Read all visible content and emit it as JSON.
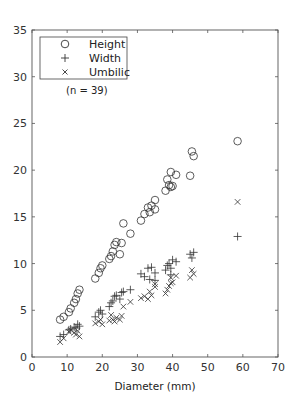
{
  "chart_data": {
    "type": "scatter",
    "title": "",
    "xlabel": "Diameter (mm)",
    "ylabel": "",
    "xlim": [
      0,
      70
    ],
    "ylim": [
      0,
      35
    ],
    "xticks": [
      0,
      10,
      20,
      30,
      40,
      50,
      60,
      70
    ],
    "yticks": [
      0,
      5,
      10,
      15,
      20,
      25,
      30,
      35
    ],
    "grid": false,
    "legend_position": "upper left",
    "annotations": [
      "(n = 39)"
    ],
    "series": [
      {
        "name": "Height",
        "marker": "circle",
        "points": [
          [
            8,
            4.0
          ],
          [
            9,
            4.3
          ],
          [
            10.5,
            4.8
          ],
          [
            11,
            5.2
          ],
          [
            12,
            5.8
          ],
          [
            12.5,
            6.2
          ],
          [
            13,
            6.8
          ],
          [
            13.5,
            7.2
          ],
          [
            18,
            8.4
          ],
          [
            19,
            9.0
          ],
          [
            19.5,
            9.5
          ],
          [
            20,
            9.8
          ],
          [
            22,
            10.5
          ],
          [
            22.5,
            10.8
          ],
          [
            23,
            11.3
          ],
          [
            23.5,
            12.0
          ],
          [
            24,
            12.3
          ],
          [
            25,
            11.0
          ],
          [
            25.5,
            12.2
          ],
          [
            26,
            14.3
          ],
          [
            28,
            13.2
          ],
          [
            31,
            14.6
          ],
          [
            32,
            15.3
          ],
          [
            33,
            16.0
          ],
          [
            33.5,
            15.5
          ],
          [
            34,
            16.2
          ],
          [
            35,
            16.8
          ],
          [
            35,
            15.8
          ],
          [
            38,
            17.8
          ],
          [
            38.5,
            19.0
          ],
          [
            39,
            18.4
          ],
          [
            39.5,
            19.8
          ],
          [
            39.5,
            18.2
          ],
          [
            40,
            18.3
          ],
          [
            41,
            19.5
          ],
          [
            45,
            19.4
          ],
          [
            45.5,
            22.0
          ],
          [
            46,
            21.5
          ],
          [
            58.5,
            23.1
          ]
        ]
      },
      {
        "name": "Width",
        "marker": "plus",
        "points": [
          [
            8,
            2.2
          ],
          [
            9,
            2.4
          ],
          [
            10.5,
            2.9
          ],
          [
            11,
            3.0
          ],
          [
            12,
            3.2
          ],
          [
            12.5,
            3.1
          ],
          [
            13,
            3.5
          ],
          [
            13.5,
            3.3
          ],
          [
            18,
            4.3
          ],
          [
            19,
            4.8
          ],
          [
            19.5,
            5.0
          ],
          [
            20,
            4.6
          ],
          [
            22,
            5.4
          ],
          [
            22.5,
            5.8
          ],
          [
            23,
            6.0
          ],
          [
            23.5,
            6.5
          ],
          [
            24,
            6.6
          ],
          [
            25,
            6.2
          ],
          [
            25.5,
            6.9
          ],
          [
            26,
            7.0
          ],
          [
            28,
            7.2
          ],
          [
            31,
            8.9
          ],
          [
            32,
            8.6
          ],
          [
            33,
            9.5
          ],
          [
            33.5,
            8.3
          ],
          [
            34,
            9.6
          ],
          [
            35,
            9.0
          ],
          [
            35,
            8.2
          ],
          [
            38,
            9.3
          ],
          [
            38.5,
            9.8
          ],
          [
            39,
            10.0
          ],
          [
            39.5,
            9.5
          ],
          [
            39.5,
            8.8
          ],
          [
            40,
            10.4
          ],
          [
            41,
            10.2
          ],
          [
            45,
            11.0
          ],
          [
            45.5,
            10.6
          ],
          [
            46,
            11.2
          ],
          [
            58.5,
            12.9
          ]
        ]
      },
      {
        "name": "Umbilic",
        "marker": "x",
        "points": [
          [
            8,
            1.6
          ],
          [
            9,
            2.0
          ],
          [
            10.5,
            2.7
          ],
          [
            11,
            2.9
          ],
          [
            12,
            2.6
          ],
          [
            12.5,
            2.4
          ],
          [
            13,
            2.8
          ],
          [
            13.5,
            2.2
          ],
          [
            18,
            3.6
          ],
          [
            19,
            3.8
          ],
          [
            19.5,
            4.0
          ],
          [
            20,
            3.5
          ],
          [
            22,
            3.9
          ],
          [
            22.5,
            4.5
          ],
          [
            23,
            4.0
          ],
          [
            23.5,
            3.8
          ],
          [
            24,
            4.2
          ],
          [
            25,
            4.0
          ],
          [
            25.5,
            4.4
          ],
          [
            26,
            5.4
          ],
          [
            28,
            5.9
          ],
          [
            31,
            6.3
          ],
          [
            32,
            6.5
          ],
          [
            33,
            6.2
          ],
          [
            33.5,
            7.0
          ],
          [
            34,
            6.6
          ],
          [
            35,
            7.5
          ],
          [
            35,
            7.8
          ],
          [
            38,
            6.8
          ],
          [
            38.5,
            7.2
          ],
          [
            39,
            7.6
          ],
          [
            39.5,
            7.9
          ],
          [
            39.5,
            8.5
          ],
          [
            40,
            8.0
          ],
          [
            41,
            8.7
          ],
          [
            45,
            8.5
          ],
          [
            45.5,
            9.3
          ],
          [
            46,
            8.9
          ],
          [
            58.5,
            16.6
          ]
        ]
      }
    ]
  },
  "legend": {
    "items": [
      {
        "label": "Height",
        "marker": "circle"
      },
      {
        "label": "Width",
        "marker": "plus"
      },
      {
        "label": "Umbilic",
        "marker": "x"
      }
    ],
    "note": "(n = 39)"
  },
  "axes": {
    "xlabel": "Diameter (mm)",
    "xtick_labels": [
      "0",
      "10",
      "20",
      "30",
      "40",
      "50",
      "60",
      "70"
    ],
    "ytick_labels": [
      "0",
      "5",
      "10",
      "15",
      "20",
      "25",
      "30",
      "35"
    ]
  },
  "colors": {
    "marker": "#333333",
    "axis": "#555555",
    "text": "#222222",
    "background": "#ffffff"
  }
}
